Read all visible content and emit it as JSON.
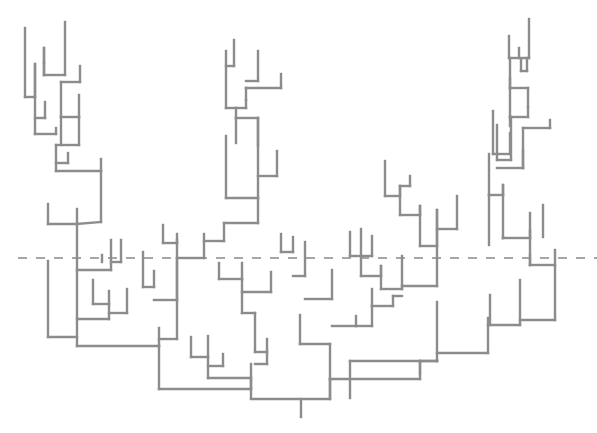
{
  "diagram": {
    "type": "dendrogram",
    "width": 597,
    "height": 433,
    "colors": {
      "branch": "#8c8c8c",
      "cut_line": "#a6a6a6",
      "background": "#ffffff"
    },
    "cut_line": {
      "y": 258,
      "x1": 18,
      "x2": 597,
      "style": "dashed"
    },
    "root": {
      "x": 301,
      "y1": 399,
      "y2": 417
    },
    "segments": [
      [
        25,
        28,
        25,
        97
      ],
      [
        25,
        97,
        35,
        97
      ],
      [
        44,
        63,
        44,
        75
      ],
      [
        44,
        75,
        65,
        75
      ],
      [
        65,
        75,
        65,
        22
      ],
      [
        44,
        63,
        44,
        48
      ],
      [
        44,
        48,
        44,
        75
      ],
      [
        35,
        97,
        35,
        64
      ],
      [
        35,
        64,
        35,
        134
      ],
      [
        61,
        82,
        61,
        117
      ],
      [
        61,
        82,
        80,
        82
      ],
      [
        80,
        82,
        80,
        66
      ],
      [
        61,
        117,
        79,
        117
      ],
      [
        79,
        117,
        79,
        95
      ],
      [
        61,
        117,
        61,
        145
      ],
      [
        45,
        118,
        45,
        102
      ],
      [
        35,
        118,
        45,
        118
      ],
      [
        35,
        134,
        56,
        134
      ],
      [
        56,
        134,
        56,
        128
      ],
      [
        56,
        145,
        79,
        145
      ],
      [
        79,
        145,
        79,
        117
      ],
      [
        56,
        145,
        56,
        171
      ],
      [
        56,
        163,
        68,
        163
      ],
      [
        68,
        163,
        68,
        153
      ],
      [
        56,
        171,
        101,
        171
      ],
      [
        101,
        171,
        101,
        159
      ],
      [
        101,
        171,
        101,
        222
      ],
      [
        48,
        204,
        48,
        224
      ],
      [
        48,
        224,
        77,
        224
      ],
      [
        77,
        224,
        77,
        209
      ],
      [
        77,
        224,
        101,
        222
      ],
      [
        77,
        224,
        77,
        346
      ],
      [
        77,
        270,
        111,
        270
      ],
      [
        111,
        270,
        111,
        240
      ],
      [
        102,
        255,
        102,
        262
      ],
      [
        111,
        262,
        121,
        262
      ],
      [
        121,
        262,
        121,
        240
      ],
      [
        93,
        280,
        93,
        304
      ],
      [
        93,
        304,
        109,
        304
      ],
      [
        109,
        304,
        109,
        291
      ],
      [
        109,
        313,
        127,
        313
      ],
      [
        127,
        313,
        127,
        289
      ],
      [
        77,
        319,
        109,
        319
      ],
      [
        109,
        319,
        109,
        304
      ],
      [
        48,
        261,
        48,
        337
      ],
      [
        48,
        337,
        77,
        337
      ],
      [
        77,
        346,
        159,
        346
      ],
      [
        159,
        346,
        159,
        328
      ],
      [
        159,
        346,
        159,
        389
      ],
      [
        143,
        252,
        143,
        287
      ],
      [
        143,
        287,
        154,
        287
      ],
      [
        154,
        287,
        154,
        271
      ],
      [
        154,
        300,
        177,
        300
      ],
      [
        177,
        300,
        177,
        258
      ],
      [
        163,
        225,
        163,
        243
      ],
      [
        163,
        243,
        177,
        243
      ],
      [
        177,
        243,
        177,
        234
      ],
      [
        177,
        258,
        204,
        258
      ],
      [
        204,
        258,
        204,
        234
      ],
      [
        177,
        240,
        177,
        339
      ],
      [
        159,
        339,
        177,
        339
      ],
      [
        204,
        241,
        224,
        241
      ],
      [
        224,
        241,
        224,
        223
      ],
      [
        224,
        223,
        258,
        223
      ],
      [
        258,
        223,
        258,
        199
      ],
      [
        226,
        136,
        226,
        198
      ],
      [
        226,
        198,
        258,
        198
      ],
      [
        258,
        198,
        258,
        118
      ],
      [
        236,
        118,
        236,
        143
      ],
      [
        236,
        118,
        258,
        118
      ],
      [
        258,
        118,
        258,
        146
      ],
      [
        258,
        176,
        277,
        176
      ],
      [
        277,
        176,
        277,
        151
      ],
      [
        236,
        108,
        236,
        118
      ],
      [
        236,
        108,
        246,
        108
      ],
      [
        246,
        108,
        246,
        100
      ],
      [
        246,
        100,
        246,
        88
      ],
      [
        246,
        88,
        281,
        88
      ],
      [
        281,
        88,
        281,
        74
      ],
      [
        226,
        51,
        226,
        108
      ],
      [
        226,
        108,
        236,
        108
      ],
      [
        234,
        40,
        234,
        66
      ],
      [
        226,
        66,
        234,
        66
      ],
      [
        246,
        81,
        258,
        81
      ],
      [
        258,
        81,
        258,
        51
      ],
      [
        219,
        263,
        219,
        279
      ],
      [
        219,
        279,
        242,
        279
      ],
      [
        242,
        279,
        242,
        263
      ],
      [
        242,
        279,
        242,
        313
      ],
      [
        242,
        292,
        271,
        292
      ],
      [
        271,
        292,
        271,
        272
      ],
      [
        242,
        313,
        255,
        313
      ],
      [
        255,
        313,
        255,
        352
      ],
      [
        255,
        352,
        267,
        352
      ],
      [
        267,
        352,
        267,
        339
      ],
      [
        255,
        364,
        267,
        364
      ],
      [
        267,
        364,
        267,
        352
      ],
      [
        251,
        364,
        251,
        398
      ],
      [
        191,
        337,
        191,
        357
      ],
      [
        191,
        357,
        208,
        357
      ],
      [
        208,
        357,
        208,
        336
      ],
      [
        208,
        366,
        223,
        366
      ],
      [
        223,
        366,
        223,
        354
      ],
      [
        208,
        378,
        251,
        378
      ],
      [
        208,
        357,
        208,
        378
      ],
      [
        159,
        389,
        251,
        389
      ],
      [
        251,
        389,
        251,
        378
      ],
      [
        251,
        399,
        330,
        399
      ],
      [
        330,
        399,
        330,
        379
      ],
      [
        330,
        379,
        330,
        398
      ],
      [
        281,
        234,
        281,
        252
      ],
      [
        281,
        252,
        293,
        252
      ],
      [
        293,
        252,
        293,
        237
      ],
      [
        293,
        276,
        305,
        276
      ],
      [
        305,
        276,
        305,
        242
      ],
      [
        305,
        299,
        332,
        299
      ],
      [
        332,
        299,
        332,
        270
      ],
      [
        332,
        326,
        356,
        326
      ],
      [
        356,
        326,
        356,
        316
      ],
      [
        300,
        315,
        300,
        344
      ],
      [
        300,
        344,
        330,
        344
      ],
      [
        330,
        344,
        330,
        379
      ],
      [
        350,
        232,
        350,
        256
      ],
      [
        350,
        256,
        372,
        256
      ],
      [
        361,
        229,
        361,
        256
      ],
      [
        372,
        256,
        372,
        236
      ],
      [
        361,
        256,
        361,
        276
      ],
      [
        361,
        276,
        381,
        276
      ],
      [
        381,
        276,
        381,
        266
      ],
      [
        381,
        266,
        381,
        289
      ],
      [
        381,
        289,
        402,
        289
      ],
      [
        402,
        289,
        402,
        256
      ],
      [
        372,
        289,
        372,
        306
      ],
      [
        372,
        306,
        393,
        306
      ],
      [
        393,
        306,
        393,
        296
      ],
      [
        372,
        306,
        372,
        326
      ],
      [
        356,
        326,
        372,
        326
      ],
      [
        393,
        296,
        402,
        296
      ],
      [
        385,
        161,
        385,
        196
      ],
      [
        385,
        196,
        400,
        196
      ],
      [
        400,
        196,
        400,
        186
      ],
      [
        400,
        186,
        400,
        215
      ],
      [
        400,
        186,
        410,
        186
      ],
      [
        410,
        186,
        410,
        176
      ],
      [
        400,
        215,
        420,
        215
      ],
      [
        420,
        215,
        420,
        206
      ],
      [
        420,
        206,
        420,
        246
      ],
      [
        420,
        246,
        437,
        246
      ],
      [
        437,
        246,
        437,
        210
      ],
      [
        437,
        229,
        457,
        229
      ],
      [
        457,
        229,
        457,
        196
      ],
      [
        437,
        210,
        437,
        286
      ],
      [
        402,
        286,
        437,
        286
      ],
      [
        330,
        379,
        420,
        379
      ],
      [
        420,
        379,
        420,
        361
      ],
      [
        420,
        361,
        420,
        374
      ],
      [
        420,
        361,
        437,
        361
      ],
      [
        437,
        361,
        437,
        302
      ],
      [
        437,
        361,
        437,
        360
      ],
      [
        350,
        361,
        437,
        361
      ],
      [
        350,
        361,
        350,
        398
      ],
      [
        437,
        353,
        488,
        353
      ],
      [
        488,
        353,
        488,
        318
      ],
      [
        488,
        325,
        520,
        325
      ],
      [
        520,
        325,
        520,
        280
      ],
      [
        490,
        295,
        490,
        325
      ],
      [
        520,
        320,
        555,
        320
      ],
      [
        555,
        320,
        555,
        267
      ],
      [
        530,
        255,
        530,
        265
      ],
      [
        530,
        265,
        555,
        265
      ],
      [
        555,
        265,
        555,
        250
      ],
      [
        503,
        237,
        503,
        238
      ],
      [
        503,
        238,
        530,
        238
      ],
      [
        530,
        238,
        530,
        213
      ],
      [
        530,
        230,
        530,
        265
      ],
      [
        543,
        237,
        543,
        205
      ],
      [
        489,
        195,
        489,
        245
      ],
      [
        489,
        195,
        503,
        195
      ],
      [
        503,
        195,
        503,
        185
      ],
      [
        503,
        185,
        503,
        238
      ],
      [
        489,
        154,
        489,
        195
      ],
      [
        493,
        111,
        493,
        154
      ],
      [
        493,
        154,
        510,
        154
      ],
      [
        510,
        154,
        510,
        133
      ],
      [
        497,
        125,
        497,
        160
      ],
      [
        497,
        160,
        511,
        160
      ],
      [
        511,
        160,
        511,
        117
      ],
      [
        497,
        168,
        523,
        168
      ],
      [
        523,
        168,
        523,
        128
      ],
      [
        523,
        128,
        550,
        128
      ],
      [
        550,
        128,
        550,
        120
      ],
      [
        523,
        150,
        523,
        168
      ],
      [
        510,
        117,
        510,
        126
      ],
      [
        510,
        78,
        510,
        117
      ],
      [
        510,
        117,
        528,
        117
      ],
      [
        528,
        117,
        528,
        107
      ],
      [
        528,
        107,
        528,
        88
      ],
      [
        510,
        88,
        528,
        88
      ],
      [
        510,
        58,
        510,
        88
      ],
      [
        521,
        59,
        521,
        71
      ],
      [
        521,
        71,
        527,
        71
      ],
      [
        527,
        71,
        527,
        58
      ],
      [
        509,
        36,
        509,
        58
      ],
      [
        509,
        58,
        529,
        58
      ],
      [
        529,
        58,
        529,
        19
      ],
      [
        519,
        48,
        519,
        58
      ]
    ]
  }
}
